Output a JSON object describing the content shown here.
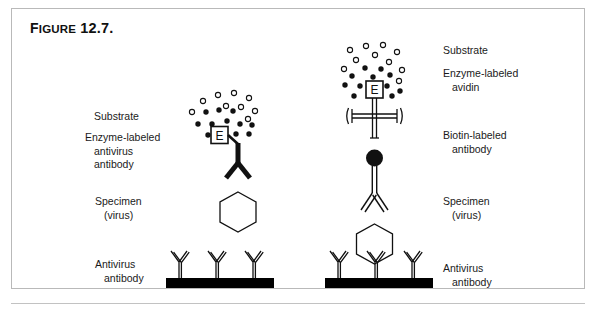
{
  "figure": {
    "title_word": "Figure",
    "title_number": "12.7."
  },
  "left_panel": {
    "name": "direct-enzyme-immunoassay",
    "labels": {
      "substrate": "Substrate",
      "enzyme_conjugate_line1": "Enzyme-labeled",
      "enzyme_conjugate_line2": "antivirus",
      "enzyme_conjugate_line3": "antibody",
      "specimen_line1": "Specimen",
      "specimen_line2": "(virus)",
      "capture_line1": "Antivirus",
      "capture_line2": "antibody"
    },
    "enzyme_box_letter": "E"
  },
  "right_panel": {
    "name": "avidin-biotin-enzyme-immunoassay",
    "labels": {
      "substrate": "Substrate",
      "avidin_line1": "Enzyme-labeled",
      "avidin_line2": "avidin",
      "biotin_line1": "Biotin-labeled",
      "biotin_line2": "antibody",
      "specimen_line1": "Specimen",
      "specimen_line2": "(virus)",
      "capture_line1": "Antivirus",
      "capture_line2": "antibody"
    },
    "enzyme_box_letter": "E"
  },
  "colors": {
    "ink": "#111111",
    "paper": "#ffffff",
    "frame": "#b9b9b9",
    "solid_phase": "#000000"
  }
}
